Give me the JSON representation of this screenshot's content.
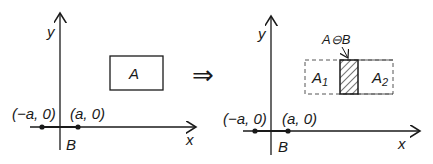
{
  "left_panel": {
    "y_axis_label": "y",
    "x_axis_label": "x",
    "rect_label": "A",
    "point_neg_label": "(−a, 0)",
    "point_pos_label": "(a, 0)",
    "segment_label": "B"
  },
  "transition": {
    "symbol": "⇒"
  },
  "right_panel": {
    "y_axis_label": "y",
    "x_axis_label": "x",
    "result_label": "A⊖B",
    "left_part_label": "A",
    "left_part_sub": "1",
    "right_part_label": "A",
    "right_part_sub": "2",
    "point_neg_label": "(−a, 0)",
    "point_pos_label": "(a, 0)",
    "segment_label": "B"
  },
  "colors": {
    "ink": "#1a1a1a",
    "dashed": "#555555",
    "background": "#ffffff"
  }
}
